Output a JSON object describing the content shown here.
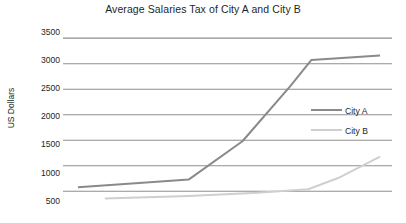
{
  "chart_data": {
    "type": "line",
    "title": "Average Salaries Tax of City A and City B",
    "xlabel": "",
    "ylabel": "US Dollars",
    "ylim": [
      330,
      3640
    ],
    "yticks": [
      500,
      1000,
      1500,
      2000,
      2500,
      3000,
      3500
    ],
    "ytick_labels": [
      "500",
      "1000",
      "1500",
      "2000",
      "2500",
      "3000",
      "3500"
    ],
    "xlim": [
      0,
      11
    ],
    "xticks": [],
    "xtick_labels": [],
    "grid": "horizontal",
    "legend_position": "center-right",
    "series": [
      {
        "name": "City A",
        "color": "#8a8a8a",
        "x": [
          0.5,
          3.5,
          4.2,
          6.0,
          7.6,
          8.3,
          10.6
        ],
        "values": [
          580,
          700,
          730,
          1480,
          2560,
          3070,
          3160
        ]
      },
      {
        "name": "City B",
        "color": "#cfcfcf",
        "x": [
          1.4,
          4.2,
          6.5,
          8.2,
          9.2,
          10.6
        ],
        "values": [
          360,
          410,
          470,
          540,
          760,
          1180
        ]
      }
    ]
  },
  "legend": {
    "items": [
      {
        "label": "City A",
        "color": "#8a8a8a"
      },
      {
        "label": "City B",
        "color": "#cfcfcf"
      }
    ]
  },
  "axis": {
    "ylabel": "US Dollars"
  },
  "style": {
    "grid_color": "#8f8f8f",
    "background": "#ffffff",
    "text_color": "#1f1f1f"
  }
}
